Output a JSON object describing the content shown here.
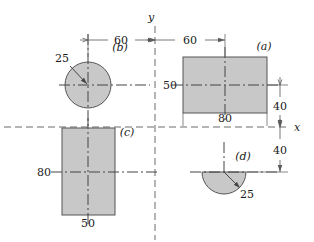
{
  "figure": {
    "type": "engineering-dimension-drawing",
    "background_color": "#ffffff",
    "shape_fill_color": "#c8c8c8",
    "shape_stroke_color": "#555555",
    "line_color": "#5a5a5a",
    "text_color": "#1a1a1a",
    "axes": {
      "x_label": "x",
      "y_label": "y"
    },
    "shapes": [
      {
        "key": "a",
        "label": "(a)",
        "kind": "rectangle",
        "width_label": "80",
        "height_label": "40",
        "center_offset_label": "60"
      },
      {
        "key": "b",
        "label": "(b)",
        "kind": "circle",
        "radius_label": "25",
        "center_offset_label": "60"
      },
      {
        "key": "c",
        "label": "(c)",
        "kind": "rectangle",
        "width_label": "50",
        "height_label": "80"
      },
      {
        "key": "d",
        "label": "(d)",
        "kind": "semicircle",
        "radius_label": "25"
      }
    ],
    "dimensions": {
      "left_horizontal": "60",
      "right_horizontal": "60",
      "upper_vertical": "40",
      "lower_vertical": "40",
      "center_height": "50",
      "rect_a_width": "80",
      "rect_c_height": "80",
      "rect_c_width": "50",
      "circle_b_radius": "25",
      "semicircle_d_radius": "25"
    }
  }
}
